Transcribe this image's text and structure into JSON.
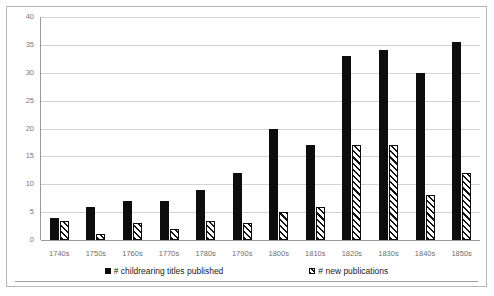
{
  "chart_data": {
    "type": "bar",
    "title": "",
    "subtitle": "",
    "xlabel": "",
    "ylabel": "",
    "ylim": [
      0,
      40
    ],
    "ytick_step": 5,
    "yticks": [
      "0",
      "5",
      "10",
      "15",
      "20",
      "25",
      "30",
      "35",
      "40"
    ],
    "grid": "horizontal",
    "legend_position": "bottom",
    "categories": [
      "1740s",
      "1750s",
      "1760s",
      "1770s",
      "1780s",
      "1790s",
      "1800s",
      "1810s",
      "1820s",
      "1830s",
      "1840s",
      "1850s"
    ],
    "series": [
      {
        "name": "# childrearing titles published",
        "style": "solid-black",
        "color": "#0d0d0d",
        "values": [
          4,
          6,
          7,
          7,
          9,
          12,
          20,
          17,
          33,
          34,
          30,
          35.5
        ]
      },
      {
        "name": "# new publications",
        "style": "white-with-black-diagonal-hatch",
        "color": "#ffffff",
        "values": [
          3.5,
          1,
          3,
          2,
          3.5,
          3,
          5,
          6,
          17,
          17,
          8,
          12
        ]
      }
    ]
  },
  "legend": {
    "items": [
      {
        "label": "# childrearing titles published",
        "swatch": "solid-square-icon"
      },
      {
        "label": "# new publications",
        "swatch": "hatched-square-icon"
      }
    ]
  },
  "colors": {
    "series_solid": "#0d0d0d",
    "series_hatched_fill": "#ffffff",
    "gridline": "#d2d2d2",
    "axis": "#9a9a9a",
    "frame": "#b6b6b6",
    "tick_text": "#7a7a7a",
    "legend_text": "#1b1b1b"
  }
}
